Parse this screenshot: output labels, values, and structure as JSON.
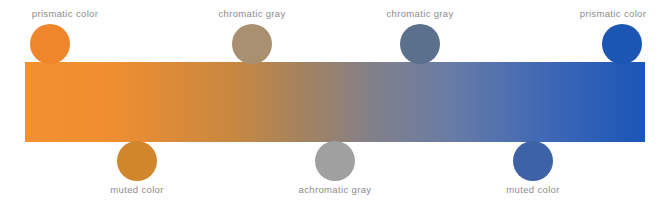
{
  "diagram": {
    "background_color": "#fefefe",
    "label_color": "#8d8d8f"
  },
  "spectrum_bar": {
    "name": "orange-to-blue gradient bar",
    "x": 25,
    "y": 62,
    "width": 620,
    "height": 80,
    "stops": [
      {
        "position": "0%",
        "color": "#F4902F"
      },
      {
        "position": "14%",
        "color": "#EF8E31"
      },
      {
        "position": "33%",
        "color": "#C9883F"
      },
      {
        "position": "46%",
        "color": "#A08264"
      },
      {
        "position": "56%",
        "color": "#82808A"
      },
      {
        "position": "68%",
        "color": "#6A7CA4"
      },
      {
        "position": "84%",
        "color": "#3F68B5"
      },
      {
        "position": "100%",
        "color": "#1B56B8"
      }
    ]
  },
  "swatches_top": [
    {
      "name": "prismatic-orange",
      "label": "prismatic color",
      "color": "#F0862B",
      "center_x": 50,
      "label_x": 65
    },
    {
      "name": "chromatic-gray-warm",
      "label": "chromatic gray",
      "color": "#A89070",
      "center_x": 252,
      "label_x": 252
    },
    {
      "name": "chromatic-gray-cool",
      "label": "chromatic gray",
      "color": "#5B708C",
      "center_x": 420,
      "label_x": 420
    },
    {
      "name": "prismatic-blue",
      "label": "prismatic color",
      "color": "#1C56B4",
      "center_x": 622,
      "label_x": 613
    }
  ],
  "swatches_bottom": [
    {
      "name": "muted-orange",
      "label": "muted color",
      "color": "#D1862B",
      "center_x": 137,
      "label_x": 137
    },
    {
      "name": "achromatic-gray",
      "label": "achromatic gray",
      "color": "#A0A0A0",
      "center_x": 335,
      "label_x": 335
    },
    {
      "name": "muted-blue",
      "label": "muted color",
      "color": "#3D63A6",
      "center_x": 533,
      "label_x": 533
    }
  ]
}
